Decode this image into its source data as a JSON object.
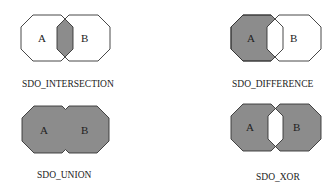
{
  "colors": {
    "fill": "#8c8c8c",
    "empty": "#ffffff",
    "stroke": "#333333"
  },
  "panels": [
    {
      "id": "intersection",
      "caption": "SDO_INTERSECTION",
      "shape_a_label": "A",
      "shape_b_label": "B",
      "shaded_region": "A ∩ B"
    },
    {
      "id": "difference",
      "caption": "SDO_DIFFERENCE",
      "shape_a_label": "A",
      "shape_b_label": "B",
      "shaded_region": "A − B"
    },
    {
      "id": "union",
      "caption": "SDO_UNION",
      "shape_a_label": "A",
      "shape_b_label": "B",
      "shaded_region": "A ∪ B"
    },
    {
      "id": "xor",
      "caption": "SDO_XOR",
      "shape_a_label": "A",
      "shape_b_label": "B",
      "shaded_region": "A ⊕ B"
    }
  ]
}
